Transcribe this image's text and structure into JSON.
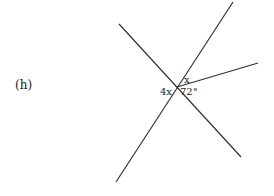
{
  "problem": {
    "label": "(h)"
  },
  "diagram": {
    "intersection": [
      177,
      87
    ],
    "lines": [
      {
        "id": "line-a",
        "from": [
          119,
          24
        ],
        "to": [
          241,
          157
        ]
      },
      {
        "id": "line-b",
        "from": [
          233,
          2
        ],
        "to": [
          116,
          182
        ]
      },
      {
        "id": "ray-c",
        "from": [
          177,
          87
        ],
        "to": [
          258,
          63
        ]
      }
    ],
    "angles": {
      "left": "4x",
      "upper": "x",
      "lower": "72°"
    },
    "stroke_color": "#333333"
  }
}
